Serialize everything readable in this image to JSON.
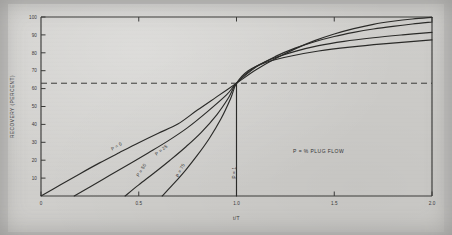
{
  "chart_data": {
    "type": "line",
    "title": "",
    "xlabel": "t/T",
    "ylabel": "RECOVERY (PERCENT)",
    "xlim": [
      0,
      2.0
    ],
    "ylim": [
      0,
      100
    ],
    "xticks": [
      "0",
      "0.5",
      "1.0",
      "1.5",
      "2.0"
    ],
    "xtick_values": [
      0,
      0.5,
      1.0,
      1.5,
      2.0
    ],
    "yticks": [
      "10",
      "20",
      "30",
      "40",
      "50",
      "60",
      "70",
      "80",
      "90",
      "100"
    ],
    "ytick_values": [
      10,
      20,
      30,
      40,
      50,
      60,
      70,
      80,
      90,
      100
    ],
    "grid": false,
    "legend": "none",
    "annotation": "P = % PLUG FLOW",
    "convergence_point": {
      "x": 1.0,
      "y": 63
    },
    "reference_line": {
      "orientation": "horizontal",
      "y": 63,
      "style": "dashed"
    },
    "series": [
      {
        "name": "P = 0",
        "label": "P = 0",
        "label_x": 0.39,
        "label_y": 27,
        "label_rotation": -31,
        "points": [
          [
            0.0,
            0.0
          ],
          [
            0.1,
            6.3
          ],
          [
            0.2,
            12.5
          ],
          [
            0.3,
            18.5
          ],
          [
            0.4,
            24.2
          ],
          [
            0.5,
            29.8
          ],
          [
            0.6,
            35.1
          ],
          [
            0.7,
            40.2
          ],
          [
            0.8,
            48.0
          ],
          [
            0.9,
            55.5
          ],
          [
            1.0,
            63.0
          ],
          [
            1.1,
            70.5
          ],
          [
            1.2,
            76.8
          ],
          [
            1.3,
            82.2
          ],
          [
            1.4,
            86.8
          ],
          [
            1.5,
            90.5
          ],
          [
            1.6,
            93.5
          ],
          [
            1.7,
            95.9
          ],
          [
            1.8,
            97.6
          ],
          [
            1.9,
            98.9
          ],
          [
            2.0,
            99.8
          ]
        ]
      },
      {
        "name": "P = 25",
        "label": "P = 25",
        "label_x": 0.62,
        "label_y": 25,
        "label_rotation": -38,
        "points": [
          [
            0.17,
            0.0
          ],
          [
            0.25,
            5.0
          ],
          [
            0.35,
            11.4
          ],
          [
            0.45,
            17.8
          ],
          [
            0.55,
            24.2
          ],
          [
            0.65,
            30.8
          ],
          [
            0.75,
            38.2
          ],
          [
            0.85,
            47.0
          ],
          [
            0.95,
            56.6
          ],
          [
            1.0,
            63.0
          ],
          [
            1.1,
            72.0
          ],
          [
            1.2,
            78.0
          ],
          [
            1.3,
            82.6
          ],
          [
            1.4,
            86.2
          ],
          [
            1.5,
            89.1
          ],
          [
            1.6,
            91.4
          ],
          [
            1.7,
            93.3
          ],
          [
            1.8,
            94.8
          ],
          [
            1.9,
            96.1
          ],
          [
            2.0,
            97.2
          ]
        ]
      },
      {
        "name": "P = 50",
        "label": "P = 50",
        "label_x": 0.52,
        "label_y": 14,
        "label_rotation": -58,
        "points": [
          [
            0.43,
            0.0
          ],
          [
            0.5,
            6.2
          ],
          [
            0.58,
            13.0
          ],
          [
            0.66,
            20.0
          ],
          [
            0.74,
            27.4
          ],
          [
            0.82,
            35.6
          ],
          [
            0.9,
            45.5
          ],
          [
            0.96,
            55.0
          ],
          [
            1.0,
            63.0
          ],
          [
            1.08,
            71.0
          ],
          [
            1.18,
            76.5
          ],
          [
            1.3,
            80.8
          ],
          [
            1.42,
            84.0
          ],
          [
            1.55,
            86.4
          ],
          [
            1.7,
            88.4
          ],
          [
            1.85,
            90.0
          ],
          [
            2.0,
            91.4
          ]
        ]
      },
      {
        "name": "P = 75",
        "label": "P = 75",
        "label_x": 0.72,
        "label_y": 14,
        "label_rotation": -64,
        "points": [
          [
            0.62,
            0.0
          ],
          [
            0.68,
            7.0
          ],
          [
            0.74,
            14.5
          ],
          [
            0.8,
            22.8
          ],
          [
            0.86,
            32.0
          ],
          [
            0.92,
            43.0
          ],
          [
            0.97,
            54.5
          ],
          [
            1.0,
            63.0
          ],
          [
            1.06,
            70.0
          ],
          [
            1.15,
            74.6
          ],
          [
            1.28,
            78.2
          ],
          [
            1.42,
            81.0
          ],
          [
            1.58,
            83.2
          ],
          [
            1.75,
            85.0
          ],
          [
            2.0,
            87.2
          ]
        ]
      },
      {
        "name": "P = 1",
        "label": "P = 1",
        "label_x": 1.0,
        "label_y": 13,
        "label_rotation": -90,
        "points": [
          [
            1.0,
            0.0
          ],
          [
            1.0,
            63.0
          ]
        ]
      }
    ]
  },
  "axes": {
    "y_title": "RECOVERY (PERCENT)",
    "x_title": "t/T"
  },
  "annotations": {
    "plug_flow": "P = % PLUG FLOW"
  }
}
